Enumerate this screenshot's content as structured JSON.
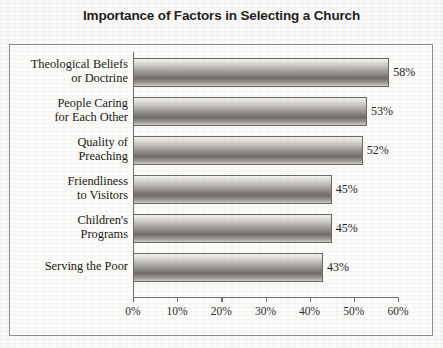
{
  "chart_data": {
    "type": "bar",
    "orientation": "horizontal",
    "title": "Importance of Factors in Selecting a Church",
    "xlabel": "",
    "ylabel": "",
    "categories": [
      "Theological Beliefs or Doctrine",
      "People Caring for Each Other",
      "Quality of Preaching",
      "Friendliness to Visitors",
      "Children's Programs",
      "Serving the Poor"
    ],
    "category_lines": [
      [
        "Theological Beliefs",
        "or Doctrine"
      ],
      [
        "People Caring",
        "for Each Other"
      ],
      [
        "Quality of",
        "Preaching"
      ],
      [
        "Friendliness",
        "to Visitors"
      ],
      [
        "Children's",
        "Programs"
      ],
      [
        "Serving the Poor"
      ]
    ],
    "values": [
      58,
      53,
      52,
      45,
      45,
      43
    ],
    "value_labels": [
      "58%",
      "53%",
      "52%",
      "45%",
      "45%",
      "43%"
    ],
    "xlim": [
      0,
      60
    ],
    "xticks": [
      0,
      10,
      20,
      30,
      40,
      50,
      60
    ],
    "xtick_labels": [
      "0%",
      "10%",
      "20%",
      "30%",
      "40%",
      "50%",
      "60%"
    ],
    "grid": false,
    "legend": null,
    "colors": {
      "bar_dark": "#6e6b68",
      "bar_light": "#f4f3f1",
      "axis": "#6f6f6f",
      "frame": "#8c8c8c",
      "text": "#17170f",
      "background": "#fbfaf8"
    }
  }
}
